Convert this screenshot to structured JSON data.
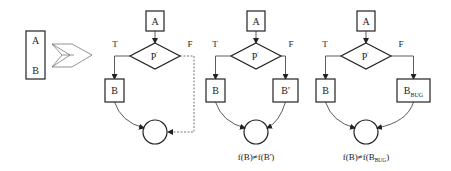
{
  "source": {
    "box_top_label": "A",
    "box_bottom_label": "B",
    "arrow_icon": "double-chevron-arrow-icon"
  },
  "diagrams": [
    {
      "name": "original",
      "top_block": "A",
      "predicate": "P",
      "predicate_mark": "'",
      "true_label": "T",
      "false_label": "F",
      "true_block": "B",
      "false_block": "",
      "false_block_sub": "",
      "false_path": "dashed-direct",
      "caption": "",
      "caption_sub": "",
      "caption_tail": ""
    },
    {
      "name": "modified",
      "top_block": "A",
      "predicate": "P",
      "predicate_mark": "'",
      "true_label": "T",
      "false_label": "F",
      "true_block": "B",
      "false_block": "B'",
      "false_block_sub": "",
      "false_path": "block",
      "caption": "f(B)≠f(B')",
      "caption_sub": "",
      "caption_tail": ""
    },
    {
      "name": "buggy",
      "top_block": "A",
      "predicate": "P",
      "predicate_mark": "'",
      "true_label": "T",
      "false_label": "F",
      "true_block": "B",
      "false_block": "B",
      "false_block_sub": "BUG",
      "false_path": "block",
      "caption": "f(B)≠f(B",
      "caption_sub": "BUG",
      "caption_tail": ")"
    }
  ]
}
